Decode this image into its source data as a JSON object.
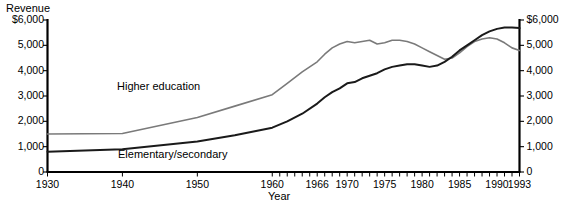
{
  "chart_data": {
    "type": "line",
    "title": "",
    "xlabel": "Year",
    "ylabel": "Revenue",
    "ylabel_unit": "$",
    "xlim": [
      1930,
      1993
    ],
    "ylim": [
      0,
      6000
    ],
    "grid": false,
    "legend": "inline-annotations",
    "y_ticks": [
      0,
      1000,
      2000,
      3000,
      4000,
      5000,
      6000
    ],
    "y_tick_labels_left": [
      "0",
      "1,000",
      "2,000",
      "3,000",
      "4,000",
      "5,000",
      "$6,000"
    ],
    "y_tick_labels_right": [
      "0",
      "1,000",
      "2,000",
      "3,000",
      "4,000",
      "5,000",
      "$6,000"
    ],
    "x_ticks": [
      1930,
      1940,
      1950,
      1960,
      1966,
      1970,
      1975,
      1980,
      1985,
      1990,
      1993
    ],
    "x_tick_labels": [
      "1930",
      "1940",
      "1950",
      "1960",
      "1966",
      "1970",
      "1975",
      "1980",
      "1985",
      "1990",
      "1993"
    ],
    "series": [
      {
        "name": "Higher education",
        "color": "#7a7a7a",
        "label_position": "above-left",
        "x": [
          1930,
          1940,
          1950,
          1955,
          1960,
          1962,
          1964,
          1966,
          1967,
          1968,
          1969,
          1970,
          1971,
          1972,
          1973,
          1974,
          1975,
          1976,
          1977,
          1978,
          1979,
          1980,
          1981,
          1982,
          1983,
          1984,
          1985,
          1986,
          1987,
          1988,
          1989,
          1990,
          1991,
          1992,
          1993
        ],
        "values": [
          1500,
          1520,
          2150,
          2600,
          3050,
          3500,
          3950,
          4350,
          4650,
          4900,
          5050,
          5150,
          5100,
          5150,
          5200,
          5050,
          5100,
          5200,
          5200,
          5150,
          5050,
          4900,
          4750,
          4600,
          4450,
          4500,
          4700,
          4950,
          5150,
          5250,
          5300,
          5250,
          5100,
          4900,
          4800
        ]
      },
      {
        "name": "Elementary/secondary",
        "color": "#1a1a1a",
        "label_position": "below",
        "x": [
          1930,
          1940,
          1950,
          1955,
          1960,
          1962,
          1964,
          1966,
          1967,
          1968,
          1969,
          1970,
          1971,
          1972,
          1973,
          1974,
          1975,
          1976,
          1977,
          1978,
          1979,
          1980,
          1981,
          1982,
          1983,
          1984,
          1985,
          1986,
          1987,
          1988,
          1989,
          1990,
          1991,
          1992,
          1993
        ],
        "values": [
          800,
          900,
          1200,
          1450,
          1750,
          2000,
          2300,
          2700,
          2950,
          3150,
          3300,
          3500,
          3550,
          3700,
          3800,
          3900,
          4050,
          4150,
          4200,
          4250,
          4250,
          4200,
          4150,
          4200,
          4350,
          4550,
          4800,
          5000,
          5200,
          5400,
          5550,
          5650,
          5700,
          5700,
          5680
        ]
      }
    ]
  },
  "axes": {
    "revenue_title": "Revenue",
    "year_title": "Year"
  }
}
